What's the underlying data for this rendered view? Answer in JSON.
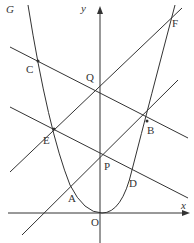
{
  "figure": {
    "curve_label": "G",
    "axis_x_label": "x",
    "axis_y_label": "y",
    "origin_label": "O",
    "points": {
      "A": "A",
      "B": "B",
      "C": "C",
      "D": "D",
      "E": "E",
      "F": "F",
      "P": "P",
      "Q": "Q"
    }
  }
}
